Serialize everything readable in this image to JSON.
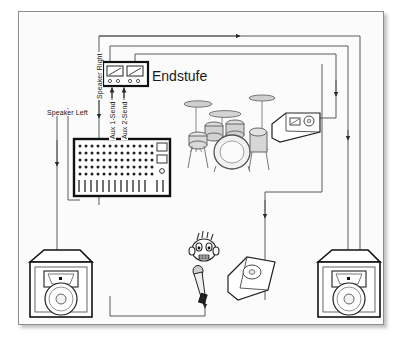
{
  "diagram": {
    "background_color": "#fbfbfb",
    "frame_color": "#8d8d8d",
    "line_color": "#3a3a3a",
    "labels": {
      "speaker_right": "Speaker Right",
      "speaker_left": "Speaker Left",
      "aux1_send": "Aux 1-Send",
      "aux2_send": "Aux 2-Send",
      "endstufe": "Endstufe"
    },
    "devices": [
      {
        "id": "power-amp",
        "name": "Endstufe",
        "type": "amplifier",
        "meters": 2,
        "knobs_per_meter": 2
      },
      {
        "id": "mixing-console",
        "name": "Mischpult",
        "type": "mixer",
        "knob_rows": 5,
        "knob_columns": 14,
        "faders": 14,
        "displays": 2,
        "rotary": 1
      },
      {
        "id": "drum-kit",
        "name": "Schlagzeug",
        "type": "drums"
      },
      {
        "id": "monitor-drummer",
        "name": "Drummer Monitor",
        "type": "wedge-monitor"
      },
      {
        "id": "monitor-singer",
        "name": "Sanger Monitor",
        "type": "wedge-monitor"
      },
      {
        "id": "speaker-left",
        "name": "Lautsprecher Links",
        "type": "pa-speaker"
      },
      {
        "id": "speaker-right",
        "name": "Lautsprecher Rechts",
        "type": "pa-speaker"
      },
      {
        "id": "singer",
        "name": "Sanger",
        "type": "person"
      },
      {
        "id": "microphone",
        "name": "Mikrofon",
        "type": "microphone"
      }
    ],
    "signal_paths": [
      {
        "from": "mixing-console",
        "to": "speaker-left",
        "label": "Speaker Left"
      },
      {
        "from": "mixing-console",
        "to": "speaker-right",
        "label": "Speaker Right"
      },
      {
        "from": "mixing-console",
        "to": "power-amp",
        "label": "Aux 1-Send"
      },
      {
        "from": "mixing-console",
        "to": "power-amp",
        "label": "Aux 2-Send"
      },
      {
        "from": "power-amp",
        "to": "monitor-drummer",
        "label": ""
      },
      {
        "from": "power-amp",
        "to": "monitor-singer",
        "label": ""
      },
      {
        "from": "microphone",
        "to": "mixing-console",
        "label": ""
      }
    ]
  }
}
